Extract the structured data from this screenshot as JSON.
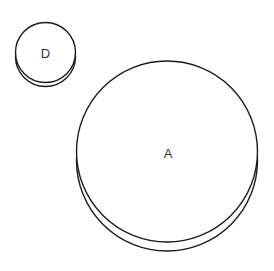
{
  "diagram": {
    "type": "cylinder-nodes",
    "background": "#ffffff",
    "stroke_color": "#1a1a1a",
    "label_color": "#333333",
    "nodes": [
      {
        "id": "D",
        "label": "D",
        "cx": 45.5,
        "cy": 52.5,
        "r": 30,
        "depth": 4
      },
      {
        "id": "A",
        "label": "A",
        "cx": 167,
        "cy": 151.5,
        "r": 90.5,
        "depth": 9
      }
    ]
  }
}
